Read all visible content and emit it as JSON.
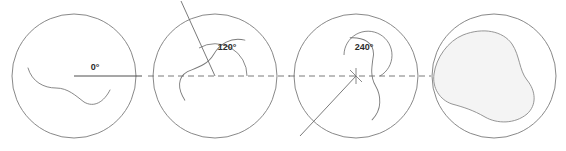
{
  "figure": {
    "name": "rotation-sequence-diagram",
    "background": "#ffffff",
    "stroke_color": "#7a7a7a",
    "label_color": "#2b2b2b",
    "fill_color": "#f4f4f4",
    "width": 566,
    "height": 151
  },
  "panels": [
    {
      "index": 1,
      "name": "panel-0-degrees",
      "angle_label": "0°",
      "angle_value": 0,
      "center": [
        74,
        76
      ],
      "radius": 62,
      "reference_line": "solid",
      "has_rotation_line": false,
      "has_arc": false,
      "filled": false
    },
    {
      "index": 2,
      "name": "panel-120-degrees",
      "angle_label": "120°",
      "angle_value": 120,
      "center": [
        215,
        76
      ],
      "radius": 62,
      "reference_line": "dashed",
      "has_rotation_line": true,
      "has_arc": true,
      "filled": false
    },
    {
      "index": 3,
      "name": "panel-240-degrees",
      "angle_label": "240°",
      "angle_value": 240,
      "center": [
        356,
        76
      ],
      "radius": 62,
      "reference_line": "dashed",
      "has_rotation_line": true,
      "has_arc": true,
      "filled": false
    },
    {
      "index": 4,
      "name": "panel-union-region",
      "angle_label": "",
      "angle_value": null,
      "center": [
        494,
        76
      ],
      "radius": 62,
      "reference_line": "none",
      "has_rotation_line": false,
      "has_arc": false,
      "filled": true
    }
  ]
}
